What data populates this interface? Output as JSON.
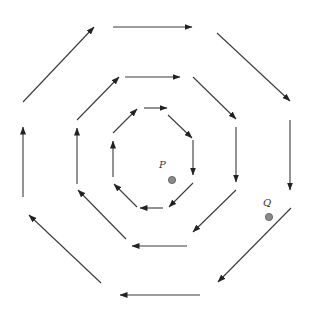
{
  "diagram": {
    "colors": {
      "line": "#3a3a3a",
      "point_fill": "#8a8a8a"
    },
    "octagons": [
      {
        "name": "outer",
        "edges": [
          [
            23,
            102,
            94,
            27
          ],
          [
            113,
            27,
            192,
            27
          ],
          [
            217,
            33,
            290,
            101
          ],
          [
            290,
            120,
            290,
            190
          ],
          [
            291,
            208,
            218,
            282
          ],
          [
            200,
            295,
            120,
            295
          ],
          [
            101,
            283,
            29,
            215
          ],
          [
            23,
            197,
            23,
            127
          ]
        ]
      },
      {
        "name": "middle",
        "edges": [
          [
            77,
            120,
            119,
            77
          ],
          [
            125,
            77,
            180,
            77
          ],
          [
            193,
            77,
            236,
            119
          ],
          [
            236,
            127,
            236,
            182
          ],
          [
            236,
            190,
            193,
            232
          ],
          [
            187,
            246,
            132,
            246
          ],
          [
            126,
            239,
            78,
            190
          ],
          [
            77,
            184,
            77,
            128
          ]
        ]
      },
      {
        "name": "inner",
        "edges": [
          [
            113,
            133,
            137,
            109
          ],
          [
            144,
            108,
            167,
            108
          ],
          [
            168,
            115,
            192,
            138
          ],
          [
            193,
            140,
            193,
            175
          ],
          [
            193,
            183,
            169,
            207
          ],
          [
            163,
            208,
            140,
            208
          ],
          [
            137,
            207,
            114,
            184
          ],
          [
            113,
            177,
            113,
            141
          ]
        ]
      }
    ],
    "points": [
      {
        "label": "P",
        "x": 172,
        "y": 180,
        "label_x": 159,
        "label_y": 168
      },
      {
        "label": "Q",
        "x": 269,
        "y": 217,
        "label_x": 263,
        "label_y": 206
      }
    ]
  }
}
